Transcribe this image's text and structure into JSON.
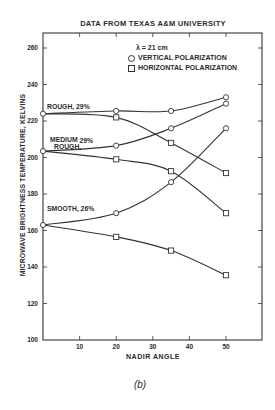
{
  "chart_data": {
    "type": "line",
    "title": "DATA FROM TEXAS A&M UNIVERSITY",
    "xlabel": "NADIR ANGLE",
    "ylabel": "MICROWAVE BRIGHTNESS TEMPERATURE, KELVINS",
    "xlim": [
      0,
      60
    ],
    "ylim": [
      100,
      270
    ],
    "x_ticks": [
      10,
      20,
      30,
      40,
      50
    ],
    "y_ticks": [
      100,
      120,
      140,
      160,
      180,
      200,
      220,
      240,
      260
    ],
    "grid": false,
    "legend": {
      "wavelength": "λ = 21 cm",
      "entries": [
        {
          "marker": "circle",
          "label": "VERTICAL POLARIZATION"
        },
        {
          "marker": "square",
          "label": "HORIZONTAL POLARIZATION"
        }
      ],
      "position": "upper center"
    },
    "x": [
      0,
      20,
      35,
      50
    ],
    "series": [
      {
        "name": "Rough, 29% - Vertical",
        "surface": "ROUGH, 29%",
        "polarization": "vertical",
        "marker": "circle",
        "values": [
          224,
          225.5,
          225.5,
          233
        ]
      },
      {
        "name": "Rough, 29% - Horizontal",
        "surface": "ROUGH, 29%",
        "polarization": "horizontal",
        "marker": "square",
        "values": [
          224,
          222,
          208,
          191.5
        ]
      },
      {
        "name": "Medium Rough, 29% - Vertical",
        "surface": "MEDIUM ROUGH, 29%",
        "polarization": "vertical",
        "marker": "circle",
        "values": [
          203.5,
          206.5,
          216,
          229.5
        ]
      },
      {
        "name": "Medium Rough, 29% - Horizontal",
        "surface": "MEDIUM ROUGH, 29%",
        "polarization": "horizontal",
        "marker": "square",
        "values": [
          203.5,
          199,
          192.5,
          169.5
        ]
      },
      {
        "name": "Smooth, 26% - Vertical",
        "surface": "SMOOTH, 26%",
        "polarization": "vertical",
        "marker": "circle",
        "values": [
          163,
          169.5,
          186.5,
          216
        ]
      },
      {
        "name": "Smooth, 26% - Horizontal",
        "surface": "SMOOTH, 26%",
        "polarization": "horizontal",
        "marker": "square",
        "values": [
          163,
          156.5,
          149,
          135.5
        ]
      }
    ],
    "annotations": [
      {
        "text": "ROUGH, 29%",
        "x": 1,
        "y": 229
      },
      {
        "text": "MEDIUM 29%",
        "x": 1,
        "y": 210
      },
      {
        "text": "ROUGH,",
        "x": 1,
        "y": 206
      },
      {
        "text": "SMOOTH, 26%",
        "x": 1,
        "y": 168
      }
    ],
    "caption": "(b)"
  },
  "labels": {
    "title": "DATA FROM TEXAS A&M UNIVERSITY",
    "xlabel": "NADIR ANGLE",
    "ylabel": "MICROWAVE BRIGHTNESS TEMPERATURE, KELVINS",
    "lambda": "λ =  21 cm",
    "legend_vertical": "VERTICAL POLARIZATION",
    "legend_horizontal": "HORIZONTAL POLARIZATION",
    "rough": "ROUGH, 29%",
    "medium_line1": "MEDIUM",
    "medium_pct": "29%",
    "medium_line2": "ROUGH,",
    "smooth": "SMOOTH, 26%",
    "caption": "(b)"
  },
  "colors": {
    "line": "#333333",
    "text": "#2a2a2a",
    "background": "#ffffff"
  }
}
